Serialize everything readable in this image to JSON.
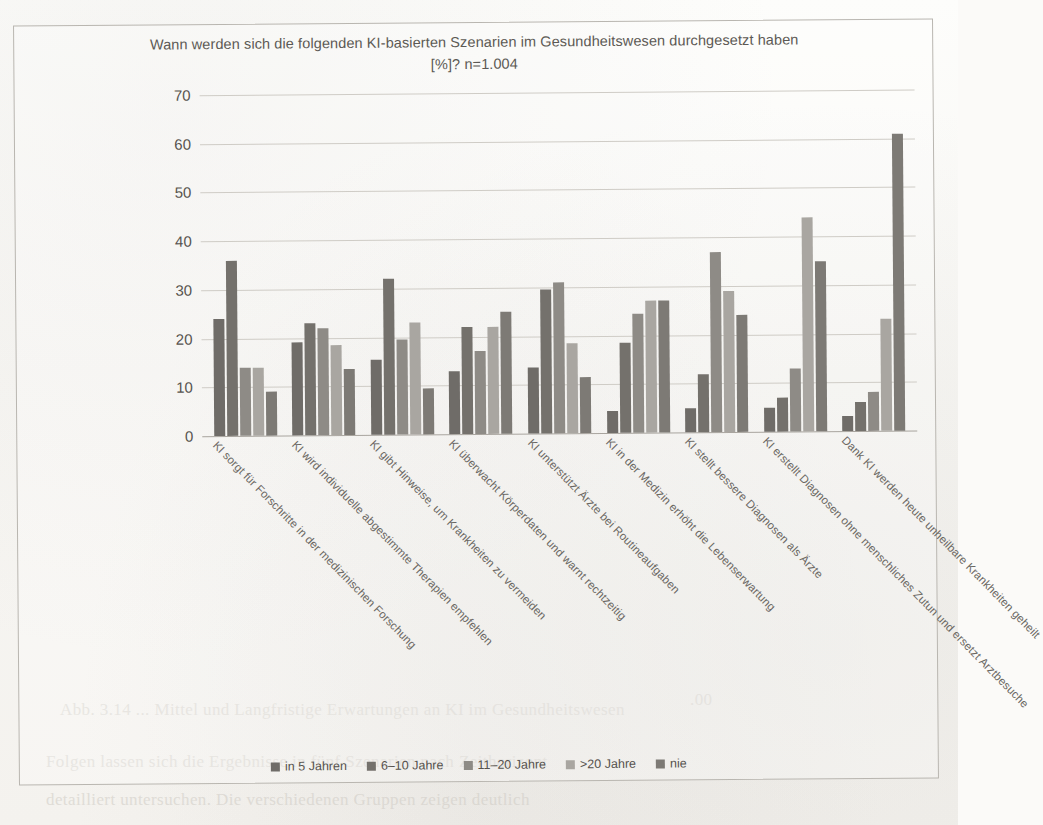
{
  "chart_data": {
    "type": "bar",
    "title": "Wann werden sich die folgenden KI-basierten Szenarien im Gesundheitswesen durchgesetzt haben [%]? n=1.004",
    "title_line1": "Wann werden sich die folgenden KI-basierten Szenarien im Gesundheitswesen durchgesetzt haben",
    "title_line2": "[%]? n=1.004",
    "xlabel": "",
    "ylabel": "",
    "ylim": [
      0,
      70
    ],
    "yticks": [
      70,
      60,
      50,
      40,
      30,
      20,
      10,
      0
    ],
    "grid": true,
    "legend_position": "bottom",
    "sample_size": "n=1.004",
    "unit": "%",
    "categories": [
      "KI sorgt für Forschritte in der medizinischen Forschung",
      "KI wird individuelle abgestimmte Therapien empfehlen",
      "KI gibt Hinweise, um Krankheiten zu vermeiden",
      "KI überwacht Körperdaten und warnt rechtzeitig",
      "KI unterstützt Ärzte bei Routineaufgaben",
      "KI in der Medizin erhöht die Lebenserwartung",
      "KI stellt bessere Diagnosen als Ärzte",
      "KI erstellt Diagnosen ohne menschliches Zutun und ersetzt Arztbesuche",
      "Dank KI werden heute unheilbare Krankheiten geheilt"
    ],
    "series": [
      {
        "name": "in 5 Jahren",
        "color": "#6f6c68",
        "values": [
          24,
          19,
          15.5,
          13,
          13.5,
          4.5,
          5,
          5,
          3
        ]
      },
      {
        "name": "6–10 Jahre",
        "color": "#74716c",
        "values": [
          36,
          23,
          32,
          22,
          29.5,
          18.5,
          12,
          7,
          6
        ]
      },
      {
        "name": "11–20 Jahre",
        "color": "#8e8b86",
        "values": [
          14,
          22,
          19.5,
          17,
          31,
          24.5,
          37,
          13,
          8
        ]
      },
      {
        "name": ">20 Jahre",
        "color": "#a9a6a1",
        "values": [
          14,
          18.5,
          23,
          22,
          18.5,
          27,
          29,
          44,
          23
        ]
      },
      {
        "name": "nie",
        "color": "#7d7a75",
        "values": [
          9,
          13.5,
          9.5,
          25,
          11.5,
          27,
          24,
          35,
          61
        ]
      }
    ]
  },
  "legend": {
    "items": [
      {
        "label": "in 5 Jahren",
        "color": "#6f6c68"
      },
      {
        "label": "6–10 Jahre",
        "color": "#74716c"
      },
      {
        "label": "11–20 Jahre",
        "color": "#8e8b86"
      },
      {
        "label": ">20 Jahre",
        "color": "#a9a6a1"
      },
      {
        "label": "nie",
        "color": "#7d7a75"
      }
    ]
  }
}
